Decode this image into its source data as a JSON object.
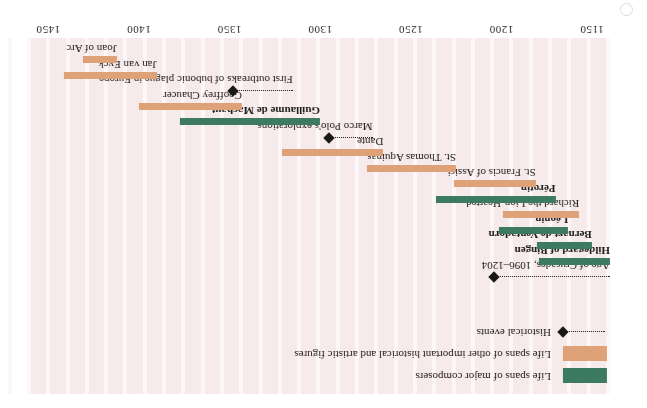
{
  "figure": {
    "orientation": "rotated-180",
    "background_color": "#f6eaea",
    "stripe_color": "#efdcdc",
    "composer_color": "#3d7a63",
    "figure_color": "#dfa177",
    "event_color": "#1a1717"
  },
  "legend": {
    "items": [
      {
        "type": "swatch",
        "style": "composer",
        "label": "Life spans of major composers"
      },
      {
        "type": "swatch",
        "style": "figure",
        "label": "Life spans of other important historical and artistic figures"
      },
      {
        "type": "event",
        "style": "event",
        "label": "Historical events"
      }
    ]
  },
  "chart_data": {
    "type": "bar",
    "title": "",
    "xlabel": "",
    "ylabel": "",
    "xlim": [
      1140,
      1460
    ],
    "grid": true,
    "legend_position": "top-left",
    "tick_labels": [
      "1150",
      "1200",
      "1250",
      "1300",
      "1350",
      "1400",
      "1450"
    ],
    "ticks": [
      1150,
      1200,
      1250,
      1300,
      1350,
      1400,
      1450
    ],
    "series": [
      {
        "name": "Life spans of major composers",
        "color": "#3d7a63"
      },
      {
        "name": "Life spans of other important historical and artistic figures",
        "color": "#dfa177"
      },
      {
        "name": "Historical events",
        "color": "#1a1717"
      }
    ],
    "rows": [
      {
        "label": "Age of Crusades, 1096–1204",
        "kind": "event",
        "start": 1140,
        "end": 1204,
        "bold": false
      },
      {
        "label": "Hildegard of Bingen",
        "kind": "composer",
        "start": 1098,
        "end": 1179,
        "bold": true
      },
      {
        "label": "Bernart de Ventadorn",
        "kind": "composer",
        "start": 1150,
        "end": 1180,
        "bold": true
      },
      {
        "label": "Léonin",
        "kind": "composer",
        "start": 1163,
        "end": 1201,
        "bold": true
      },
      {
        "label": "Richard the Lion-Hearted",
        "kind": "figure",
        "start": 1157,
        "end": 1199,
        "bold": false
      },
      {
        "label": "Pérotin",
        "kind": "composer",
        "start": 1170,
        "end": 1236,
        "bold": true
      },
      {
        "label": "St. Francis of Assisi",
        "kind": "figure",
        "start": 1181,
        "end": 1226,
        "bold": false
      },
      {
        "label": "St. Thomas Aquinas",
        "kind": "figure",
        "start": 1225,
        "end": 1274,
        "bold": false
      },
      {
        "label": "Dante",
        "kind": "figure",
        "start": 1265,
        "end": 1321,
        "bold": false
      },
      {
        "label": "Marco Polo's explorations",
        "kind": "event",
        "start": 1271,
        "end": 1295,
        "bold": false
      },
      {
        "label": "Guillaume de Machaut",
        "kind": "composer",
        "start": 1300,
        "end": 1377,
        "bold": true
      },
      {
        "label": "Geoffrey Chaucer",
        "kind": "figure",
        "start": 1343,
        "end": 1400,
        "bold": false
      },
      {
        "label": "First outbreaks of bubonic plague in Europe",
        "kind": "event",
        "start": 1315,
        "end": 1348,
        "bold": false
      },
      {
        "label": "Jan van Eyck",
        "kind": "figure",
        "start": 1390,
        "end": 1441,
        "bold": false
      },
      {
        "label": "Joan of Arc",
        "kind": "figure",
        "start": 1412,
        "end": 1431,
        "bold": false
      }
    ]
  }
}
